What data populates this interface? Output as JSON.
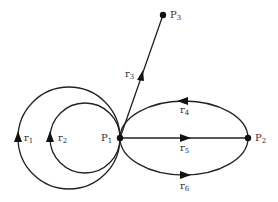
{
  "diagram": {
    "type": "directed multigraph",
    "nodes": [
      {
        "id": "P1",
        "label": "P",
        "sub": "1"
      },
      {
        "id": "P2",
        "label": "P",
        "sub": "2"
      },
      {
        "id": "P3",
        "label": "P",
        "sub": "3"
      }
    ],
    "edges": [
      {
        "id": "r1",
        "label": "r",
        "sub": "1",
        "from": "P1",
        "to": "P1",
        "shape": "large loop",
        "direction": "up (counter-clockwise on left)"
      },
      {
        "id": "r2",
        "label": "r",
        "sub": "2",
        "from": "P1",
        "to": "P1",
        "shape": "small loop",
        "direction": "up (counter-clockwise on left)"
      },
      {
        "id": "r3",
        "label": "r",
        "sub": "3",
        "from": "P1",
        "to": "P3",
        "shape": "straight"
      },
      {
        "id": "r4",
        "label": "r",
        "sub": "4",
        "from": "P2",
        "to": "P1",
        "shape": "upper arc"
      },
      {
        "id": "r5",
        "label": "r",
        "sub": "5",
        "from": "P1",
        "to": "P2",
        "shape": "straight"
      },
      {
        "id": "r6",
        "label": "r",
        "sub": "6",
        "from": "P1",
        "to": "P2",
        "shape": "lower arc"
      }
    ]
  }
}
